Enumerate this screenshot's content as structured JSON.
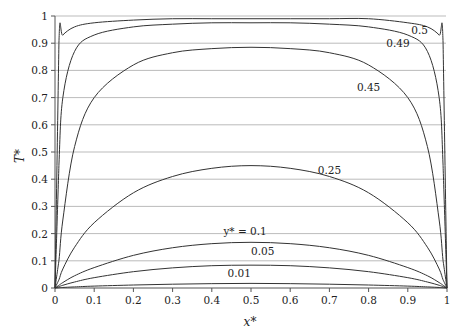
{
  "chart_data": {
    "type": "line",
    "title": "",
    "xlabel": "x*",
    "ylabel": "T*",
    "xlim": [
      0,
      1
    ],
    "ylim": [
      0,
      1
    ],
    "grid": "horizontal",
    "x_ticks": [
      "0",
      "0.1",
      "0.2",
      "0.3",
      "0.4",
      "0.5",
      "0.6",
      "0.7",
      "0.8",
      "0.9",
      "1"
    ],
    "y_ticks": [
      "0",
      "0.1",
      "0.2",
      "0.3",
      "0.4",
      "0.5",
      "0.6",
      "0.7",
      "0.8",
      "0.9",
      "1"
    ],
    "x": [
      0,
      0.01,
      0.02,
      0.05,
      0.1,
      0.2,
      0.3,
      0.4,
      0.5,
      0.6,
      0.7,
      0.8,
      0.9,
      0.95,
      0.98,
      0.99,
      1
    ],
    "series": [
      {
        "name": "0.5",
        "label": "0.5",
        "values": [
          0,
          0.9,
          0.93,
          0.96,
          0.975,
          0.985,
          0.99,
          0.99,
          0.99,
          0.99,
          0.99,
          0.99,
          0.975,
          0.96,
          0.93,
          0.9,
          0
        ]
      },
      {
        "name": "0.49",
        "label": "0.49",
        "values": [
          0,
          0.45,
          0.7,
          0.87,
          0.93,
          0.96,
          0.97,
          0.975,
          0.975,
          0.975,
          0.97,
          0.96,
          0.93,
          0.87,
          0.7,
          0.45,
          0
        ]
      },
      {
        "name": "0.45",
        "label": "0.45",
        "values": [
          0,
          0.1,
          0.25,
          0.52,
          0.7,
          0.82,
          0.865,
          0.88,
          0.885,
          0.88,
          0.865,
          0.82,
          0.7,
          0.52,
          0.25,
          0.1,
          0
        ]
      },
      {
        "name": "0.25",
        "label": "0.25",
        "values": [
          0,
          0.03,
          0.07,
          0.15,
          0.24,
          0.35,
          0.41,
          0.44,
          0.45,
          0.44,
          0.41,
          0.35,
          0.24,
          0.15,
          0.07,
          0.03,
          0
        ]
      },
      {
        "name": "0.1",
        "label": "y* = 0.1",
        "values": [
          0,
          0.01,
          0.02,
          0.045,
          0.075,
          0.12,
          0.148,
          0.163,
          0.168,
          0.163,
          0.148,
          0.12,
          0.075,
          0.045,
          0.02,
          0.01,
          0
        ]
      },
      {
        "name": "0.05",
        "label": "0.05",
        "values": [
          0,
          0.005,
          0.01,
          0.022,
          0.038,
          0.06,
          0.074,
          0.082,
          0.084,
          0.082,
          0.074,
          0.06,
          0.038,
          0.022,
          0.01,
          0.005,
          0
        ]
      },
      {
        "name": "0.01",
        "label": "0.01",
        "values": [
          0,
          0.001,
          0.002,
          0.004,
          0.007,
          0.011,
          0.014,
          0.016,
          0.017,
          0.016,
          0.014,
          0.011,
          0.007,
          0.004,
          0.002,
          0.001,
          0
        ]
      }
    ],
    "annotations": [
      {
        "text": "0.5",
        "x": 0.93,
        "y": 0.935
      },
      {
        "text": "0.49",
        "x": 0.875,
        "y": 0.885
      },
      {
        "text": "0.45",
        "x": 0.8,
        "y": 0.725
      },
      {
        "text": "0.25",
        "x": 0.7,
        "y": 0.42
      },
      {
        "text": "y* = 0.1",
        "x": 0.485,
        "y": 0.195
      },
      {
        "text": "0.05",
        "x": 0.53,
        "y": 0.12
      },
      {
        "text": "0.01",
        "x": 0.47,
        "y": 0.042
      }
    ]
  },
  "colors": {
    "line": "#333333",
    "grid": "#aaaaaa",
    "axis": "#555555"
  }
}
